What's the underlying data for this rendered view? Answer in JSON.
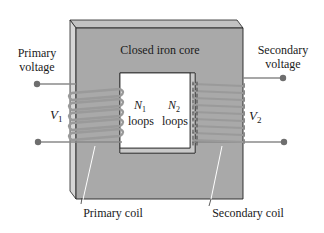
{
  "labels": {
    "core": "Closed iron core",
    "primary_voltage_line1": "Primary",
    "primary_voltage_line2": "voltage",
    "secondary_voltage_line1": "Secondary",
    "secondary_voltage_line2": "voltage",
    "v1_main": "V",
    "v1_sub": "1",
    "v2_main": "V",
    "v2_sub": "2",
    "n1_main": "N",
    "n1_sub": "1",
    "n1_loops": "loops",
    "n2_main": "N",
    "n2_sub": "2",
    "n2_loops": "loops",
    "primary_coil": "Primary coil",
    "secondary_coil": "Secondary coil"
  },
  "colors": {
    "core_face": "#a9a9a9",
    "core_top": "#bdbdbd",
    "core_edge": "#222222",
    "coil": "#9a9a9a",
    "lead": "#8a8a8a",
    "terminal": "#6e6e6e",
    "background": "#ffffff"
  },
  "coils": {
    "primary_turns_drawn": 5,
    "secondary_turns_drawn": 9
  }
}
